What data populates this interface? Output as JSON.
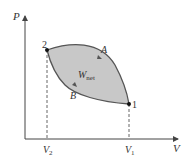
{
  "diagram": {
    "type": "P-V cycle diagram",
    "axes": {
      "y_label": "P",
      "x_label": "V"
    },
    "ticks": {
      "v2": {
        "main": "V",
        "sub": "2"
      },
      "v1": {
        "main": "V",
        "sub": "1"
      }
    },
    "points": [
      {
        "label": "2"
      },
      {
        "label": "1"
      }
    ],
    "paths": [
      {
        "label": "A"
      },
      {
        "label": "B"
      }
    ],
    "area_label": {
      "main": "W",
      "sub": "net"
    },
    "colors": {
      "fill": "#c8c8c8",
      "curve": "#555555",
      "axis": "#444444"
    }
  }
}
